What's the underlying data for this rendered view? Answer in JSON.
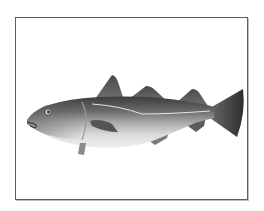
{
  "image": {
    "subject": "fish",
    "description": "Grayscale illustration of a cod-like fish in side profile facing left, inside a thin rectangular frame",
    "alt": "Cod fish"
  },
  "colors": {
    "frame": "#5e5e5e",
    "background": "#ffffff",
    "fish_dark": "#3a3a3a",
    "fish_mid": "#8a8a8a",
    "fish_light": "#e6e6e6"
  }
}
